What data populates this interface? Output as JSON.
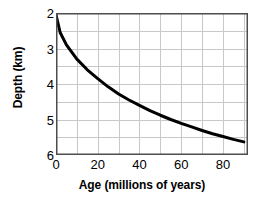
{
  "chart_data": {
    "type": "line",
    "title": "",
    "xlabel": "Age (millions of years)",
    "ylabel": "Depth (km)",
    "xlim": [
      0,
      92
    ],
    "ylim": [
      2,
      6
    ],
    "y_inverted": true,
    "grid": true,
    "legend": null,
    "x_ticks": [
      0,
      20,
      40,
      60,
      80
    ],
    "x_tick_labels": [
      "0",
      "20",
      "40",
      "60",
      "80"
    ],
    "y_ticks": [
      2,
      3,
      4,
      5,
      6
    ],
    "y_tick_labels": [
      "2",
      "3",
      "4",
      "5",
      "6"
    ],
    "x_gridlines": [
      0,
      10,
      20,
      30,
      40,
      50,
      60,
      70,
      80,
      90
    ],
    "y_gridlines": [
      2,
      2.5,
      3,
      3.5,
      4,
      4.5,
      5,
      5.5,
      6
    ],
    "series": [
      {
        "name": "ocean-floor-depth",
        "color": "#000000",
        "line_width": 3,
        "x": [
          0,
          2,
          5,
          10,
          15,
          20,
          25,
          30,
          35,
          40,
          45,
          50,
          55,
          60,
          65,
          70,
          75,
          80,
          85,
          90
        ],
        "y": [
          2.05,
          2.55,
          2.9,
          3.3,
          3.6,
          3.85,
          4.08,
          4.28,
          4.45,
          4.6,
          4.75,
          4.88,
          5.0,
          5.11,
          5.21,
          5.31,
          5.4,
          5.48,
          5.56,
          5.63
        ]
      }
    ],
    "colors": {
      "curve": "#000000",
      "grid": "#c8c8c8",
      "axis_border": "#4d4d4d",
      "background": "#ffffff",
      "text": "#000000"
    }
  }
}
